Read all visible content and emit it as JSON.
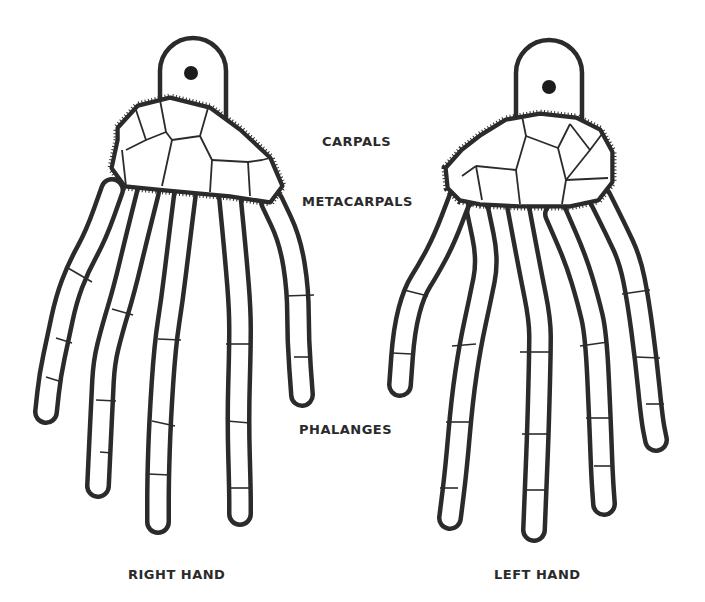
{
  "labels": {
    "carpals": "CARPALS",
    "metacarpals": "METACARPALS",
    "phalanges": "PHALANGES",
    "right_hand": "RIGHT HAND",
    "left_hand": "LEFT HAND"
  },
  "colors": {
    "ink": "#2b2b2b",
    "background": "#ffffff",
    "hole": "#1c1c1c"
  },
  "hands": {
    "right": {
      "tab": {
        "x": 160,
        "y": 38,
        "w": 66,
        "h": 82,
        "hole": [
          191,
          73
        ]
      },
      "fingers": [
        [
          [
            112,
            190
          ],
          [
            96,
            235
          ],
          [
            78,
            268
          ],
          [
            66,
            300
          ],
          [
            58,
            338
          ],
          [
            50,
            375
          ],
          [
            46,
            412
          ]
        ],
        [
          [
            148,
            192
          ],
          [
            136,
            240
          ],
          [
            124,
            290
          ],
          [
            112,
            330
          ],
          [
            104,
            362
          ],
          [
            102,
            400
          ],
          [
            98,
            486
          ]
        ],
        [
          [
            185,
            194
          ],
          [
            178,
            250
          ],
          [
            172,
            300
          ],
          [
            165,
            345
          ],
          [
            160,
            420
          ],
          [
            158,
            480
          ],
          [
            158,
            522
          ]
        ],
        [
          [
            230,
            198
          ],
          [
            236,
            260
          ],
          [
            240,
            310
          ],
          [
            240,
            348
          ],
          [
            238,
            420
          ],
          [
            240,
            490
          ],
          [
            240,
            514
          ]
        ],
        [
          [
            272,
            202
          ],
          [
            290,
            240
          ],
          [
            298,
            290
          ],
          [
            298,
            340
          ],
          [
            302,
            395
          ]
        ]
      ],
      "joints": [
        [
          [
            68,
            268
          ],
          [
            92,
            282
          ]
        ],
        [
          [
            56,
            338
          ],
          [
            72,
            343
          ]
        ],
        [
          [
            46,
            377
          ],
          [
            62,
            382
          ]
        ],
        [
          [
            112,
            309
          ],
          [
            133,
            315
          ]
        ],
        [
          [
            96,
            400
          ],
          [
            116,
            401
          ]
        ],
        [
          [
            100,
            452
          ],
          [
            112,
            453
          ]
        ],
        [
          [
            158,
            339
          ],
          [
            181,
            340
          ]
        ],
        [
          [
            152,
            421
          ],
          [
            175,
            426
          ]
        ],
        [
          [
            148,
            474
          ],
          [
            170,
            475
          ]
        ],
        [
          [
            226,
            344
          ],
          [
            250,
            344
          ]
        ],
        [
          [
            227,
            421
          ],
          [
            250,
            423
          ]
        ],
        [
          [
            230,
            488
          ],
          [
            250,
            488
          ]
        ],
        [
          [
            285,
            296
          ],
          [
            314,
            295
          ]
        ],
        [
          [
            294,
            357
          ],
          [
            312,
            357
          ]
        ]
      ],
      "carpal_outline": [
        [
          118,
          128
        ],
        [
          138,
          106
        ],
        [
          170,
          98
        ],
        [
          210,
          108
        ],
        [
          240,
          130
        ],
        [
          270,
          158
        ],
        [
          282,
          186
        ],
        [
          270,
          202
        ],
        [
          230,
          196
        ],
        [
          165,
          190
        ],
        [
          125,
          186
        ],
        [
          112,
          168
        ],
        [
          118,
          140
        ]
      ],
      "carpal_lines": [
        [
          [
            136,
            110
          ],
          [
            146,
            140
          ],
          [
            126,
            150
          ]
        ],
        [
          [
            146,
            140
          ],
          [
            166,
            132
          ],
          [
            160,
            100
          ]
        ],
        [
          [
            166,
            132
          ],
          [
            172,
            140
          ],
          [
            200,
            136
          ],
          [
            208,
            108
          ]
        ],
        [
          [
            172,
            140
          ],
          [
            162,
            186
          ]
        ],
        [
          [
            200,
            136
          ],
          [
            212,
            160
          ],
          [
            210,
            192
          ]
        ],
        [
          [
            212,
            160
          ],
          [
            248,
            162
          ],
          [
            250,
            196
          ]
        ],
        [
          [
            248,
            162
          ],
          [
            262,
            160
          ],
          [
            270,
            158
          ]
        ],
        [
          [
            122,
            150
          ],
          [
            126,
            186
          ]
        ]
      ]
    },
    "left": {
      "tab": {
        "x": 516,
        "y": 40,
        "w": 66,
        "h": 82,
        "hole": [
          549,
          87
        ]
      },
      "fingers": [
        [
          [
            460,
            198
          ],
          [
            444,
            240
          ],
          [
            428,
            270
          ],
          [
            414,
            292
          ],
          [
            404,
            330
          ],
          [
            400,
            385
          ]
        ],
        [
          [
            478,
            212
          ],
          [
            488,
            260
          ],
          [
            480,
            300
          ],
          [
            470,
            346
          ],
          [
            462,
            400
          ],
          [
            456,
            470
          ],
          [
            450,
            518
          ]
        ],
        [
          [
            518,
            206
          ],
          [
            530,
            270
          ],
          [
            540,
            320
          ],
          [
            540,
            352
          ],
          [
            538,
            430
          ],
          [
            536,
            480
          ],
          [
            534,
            530
          ]
        ],
        [
          [
            556,
            214
          ],
          [
            576,
            260
          ],
          [
            588,
            300
          ],
          [
            596,
            334
          ],
          [
            600,
            420
          ],
          [
            602,
            476
          ],
          [
            604,
            504
          ]
        ],
        [
          [
            600,
            198
          ],
          [
            616,
            230
          ],
          [
            630,
            260
          ],
          [
            638,
            300
          ],
          [
            646,
            360
          ],
          [
            652,
            420
          ],
          [
            656,
            440
          ]
        ]
      ],
      "joints": [
        [
          [
            404,
            290
          ],
          [
            428,
            296
          ]
        ],
        [
          [
            392,
            353
          ],
          [
            412,
            354
          ]
        ],
        [
          [
            452,
            346
          ],
          [
            476,
            344
          ]
        ],
        [
          [
            446,
            422
          ],
          [
            470,
            422
          ]
        ],
        [
          [
            440,
            488
          ],
          [
            458,
            488
          ]
        ],
        [
          [
            520,
            352
          ],
          [
            550,
            352
          ]
        ],
        [
          [
            522,
            434
          ],
          [
            548,
            434
          ]
        ],
        [
          [
            524,
            490
          ],
          [
            546,
            490
          ]
        ],
        [
          [
            580,
            346
          ],
          [
            608,
            342
          ]
        ],
        [
          [
            586,
            418
          ],
          [
            612,
            418
          ]
        ],
        [
          [
            594,
            466
          ],
          [
            612,
            466
          ]
        ],
        [
          [
            622,
            294
          ],
          [
            650,
            290
          ]
        ],
        [
          [
            636,
            357
          ],
          [
            660,
            358
          ]
        ],
        [
          [
            646,
            404
          ],
          [
            664,
            404
          ]
        ]
      ],
      "carpal_outline": [
        [
          446,
          168
        ],
        [
          462,
          150
        ],
        [
          480,
          136
        ],
        [
          506,
          120
        ],
        [
          540,
          114
        ],
        [
          576,
          118
        ],
        [
          600,
          130
        ],
        [
          612,
          152
        ],
        [
          612,
          182
        ],
        [
          598,
          200
        ],
        [
          570,
          206
        ],
        [
          520,
          206
        ],
        [
          480,
          204
        ],
        [
          460,
          200
        ],
        [
          448,
          188
        ]
      ],
      "carpal_lines": [
        [
          [
            476,
            166
          ],
          [
            482,
            200
          ]
        ],
        [
          [
            476,
            166
          ],
          [
            516,
            170
          ],
          [
            526,
            136
          ],
          [
            522,
            116
          ]
        ],
        [
          [
            516,
            170
          ],
          [
            520,
            204
          ]
        ],
        [
          [
            526,
            136
          ],
          [
            558,
            148
          ],
          [
            570,
            124
          ]
        ],
        [
          [
            558,
            148
          ],
          [
            566,
            180
          ],
          [
            562,
            204
          ]
        ],
        [
          [
            570,
            124
          ],
          [
            590,
            150
          ],
          [
            602,
            134
          ]
        ],
        [
          [
            590,
            150
          ],
          [
            566,
            180
          ]
        ],
        [
          [
            566,
            180
          ],
          [
            608,
            178
          ]
        ],
        [
          [
            462,
            176
          ],
          [
            476,
            166
          ]
        ]
      ]
    }
  }
}
